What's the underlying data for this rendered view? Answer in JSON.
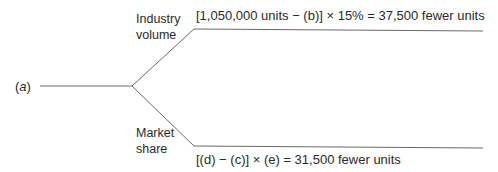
{
  "diagram": {
    "type": "tree",
    "root": {
      "label_prefix": "(",
      "label_var": "a",
      "label_suffix": ")"
    },
    "branches": [
      {
        "label": "Industry volume",
        "formula": "[1,050,000 units − (b)] × 15% = 37,500 fewer units"
      },
      {
        "label": "Market share",
        "formula": "[(d) − (c)] × (e) = 31,500 fewer units"
      }
    ],
    "colors": {
      "line": "#6a6a6a",
      "text": "#2a2a2a"
    }
  }
}
